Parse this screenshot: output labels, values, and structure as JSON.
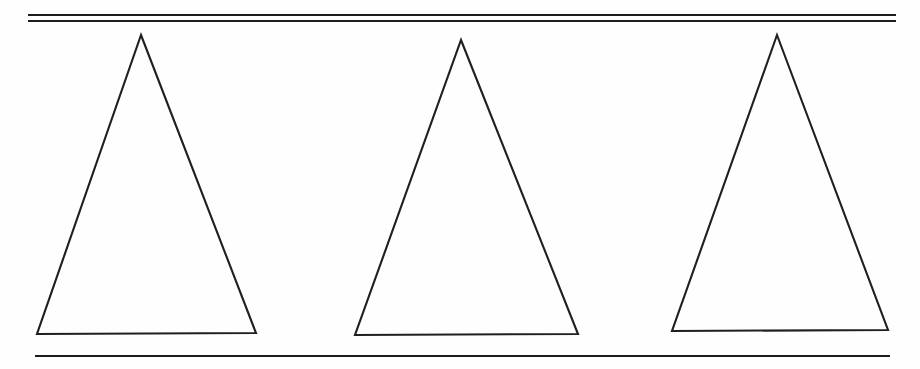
{
  "document": {
    "kind": "scanned-line-drawing",
    "title": "Three Triangles Between Horizontal Rules",
    "width": 920,
    "height": 369,
    "background_color": "#fefefe",
    "ink_color": "#1c1c1c"
  },
  "rules": {
    "top": {
      "name": "double-rule",
      "line_count": 2,
      "x_start": 28,
      "x_end": 896,
      "lines": [
        {
          "y": 15,
          "thickness": 2.0
        },
        {
          "y": 21,
          "thickness": 2.0
        }
      ]
    },
    "bottom": {
      "name": "single-rule",
      "line_count": 1,
      "x_start": 35,
      "x_end": 890,
      "lines": [
        {
          "y": 356,
          "thickness": 2.2
        }
      ]
    }
  },
  "shapes": [
    {
      "id": "triangle-1",
      "label": "Triangle 1",
      "type": "isosceles-triangle",
      "apex": {
        "x": 141,
        "y": 35
      },
      "base_left": {
        "x": 37,
        "y": 334
      },
      "base_right": {
        "x": 256,
        "y": 333
      },
      "base_width": 219,
      "height": 299,
      "points": "141,35 256,333 37,334"
    },
    {
      "id": "triangle-2",
      "label": "Triangle 2",
      "type": "isosceles-triangle",
      "apex": {
        "x": 461,
        "y": 40
      },
      "base_left": {
        "x": 355,
        "y": 335
      },
      "base_right": {
        "x": 578,
        "y": 334
      },
      "base_width": 223,
      "height": 295,
      "points": "461,40 578,334 355,335"
    },
    {
      "id": "triangle-3",
      "label": "Triangle 3",
      "type": "isosceles-triangle",
      "apex": {
        "x": 777,
        "y": 35
      },
      "base_left": {
        "x": 672,
        "y": 331
      },
      "base_right": {
        "x": 888,
        "y": 330
      },
      "base_width": 216,
      "height": 296,
      "points": "777,35 888,330 672,331"
    }
  ],
  "chart_data": {
    "type": "scatter",
    "title": "Three Triangles Between Horizontal Rules",
    "xlabel": "",
    "ylabel": "",
    "xlim": [
      0,
      920
    ],
    "ylim": [
      0,
      369
    ],
    "grid": false,
    "legend": "none",
    "annotations": [],
    "series": [
      {
        "name": "Triangle 1",
        "x": [
          141,
          256,
          37,
          141
        ],
        "y": [
          35,
          333,
          334,
          35
        ]
      },
      {
        "name": "Triangle 2",
        "x": [
          461,
          578,
          355,
          461
        ],
        "y": [
          40,
          334,
          335,
          40
        ]
      },
      {
        "name": "Triangle 3",
        "x": [
          777,
          888,
          672,
          777
        ],
        "y": [
          35,
          330,
          331,
          35
        ]
      },
      {
        "name": "Top rule line A",
        "x": [
          28,
          896
        ],
        "y": [
          15,
          15
        ]
      },
      {
        "name": "Top rule line B",
        "x": [
          28,
          896
        ],
        "y": [
          21,
          21
        ]
      },
      {
        "name": "Bottom rule line",
        "x": [
          35,
          890
        ],
        "y": [
          356,
          356
        ]
      }
    ]
  }
}
